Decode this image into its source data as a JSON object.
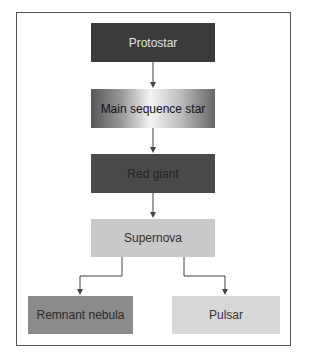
{
  "diagram": {
    "type": "flowchart",
    "direction": "top-to-bottom",
    "nodes": [
      {
        "id": "protostar",
        "label": "Protostar",
        "fill": "#3b3b3b",
        "text_color": "#e2e2e2"
      },
      {
        "id": "main_sequence",
        "label": "Main sequence star",
        "fill": "gradient gray-white-gray",
        "text_color": "#111111"
      },
      {
        "id": "red_giant",
        "label": "Red giant",
        "fill": "#4a4a4a",
        "text_color": "#242424"
      },
      {
        "id": "supernova",
        "label": "Supernova",
        "fill": "#c9c9c9",
        "text_color": "#2e2e2e"
      },
      {
        "id": "remnant_nebula",
        "label": "Remnant nebula",
        "fill": "#8b8b8b",
        "text_color": "#2a2a2a"
      },
      {
        "id": "pulsar",
        "label": "Pulsar",
        "fill": "#d7d7d7",
        "text_color": "#333333"
      }
    ],
    "edges": [
      {
        "from": "protostar",
        "to": "main_sequence"
      },
      {
        "from": "main_sequence",
        "to": "red_giant"
      },
      {
        "from": "red_giant",
        "to": "supernova"
      },
      {
        "from": "supernova",
        "to": "remnant_nebula"
      },
      {
        "from": "supernova",
        "to": "pulsar"
      }
    ],
    "colors": {
      "frame_border": "#555555",
      "connector": "#444444",
      "background": "#ffffff"
    }
  }
}
